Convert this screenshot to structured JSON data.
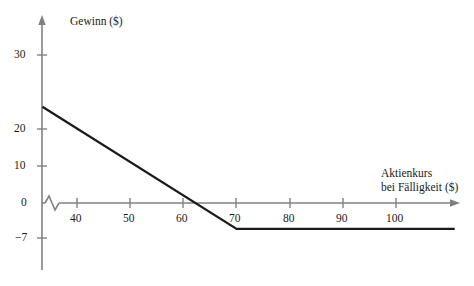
{
  "chart_data": {
    "type": "line",
    "title": "",
    "xlabel": "Aktienkurs bei Fälligkeit ($)",
    "ylabel": "Gewinn ($)",
    "xlabel_lines": [
      "Aktienkurs",
      "bei Fälligkeit ($)"
    ],
    "xlim": [
      33,
      111
    ],
    "ylim": [
      -12,
      34
    ],
    "xticks": [
      40,
      50,
      60,
      70,
      80,
      90,
      100
    ],
    "xtick_labels": [
      "40",
      "50",
      "60",
      "70",
      "80",
      "90",
      "100"
    ],
    "yticks": [
      30,
      20,
      10,
      0,
      -7
    ],
    "ytick_labels": [
      "30",
      "20",
      "10",
      "0",
      "−7"
    ],
    "grid": false,
    "legend": null,
    "axis_break_x": true,
    "series": [
      {
        "name": "Gewinn",
        "color": "#1a1a1a",
        "points": [
          {
            "x": 33.5,
            "y": 26
          },
          {
            "x": 70,
            "y": -7
          },
          {
            "x": 111,
            "y": -7
          }
        ]
      }
    ],
    "annotations": [],
    "breakeven_x": 63,
    "max_loss": -7,
    "kink_x": 70,
    "colors": {
      "axis": "#808080",
      "data_line": "#1a1a1a",
      "text": "#1a1a1a",
      "background": "#ffffff"
    }
  }
}
